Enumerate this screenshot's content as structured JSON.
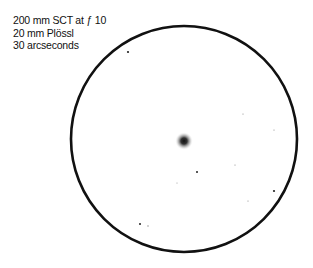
{
  "labels": {
    "line1": "200 mm SCT at ƒ 10",
    "line2": "20 mm Plössl",
    "line3": "30 arcseconds"
  },
  "field": {
    "cx": 184,
    "cy": 139,
    "r": 113,
    "ring_color": "#111111",
    "object": {
      "x": 184,
      "y": 141
    }
  },
  "stars": [
    {
      "x": 128,
      "y": 52,
      "r": 1.1
    },
    {
      "x": 197,
      "y": 172,
      "r": 1.0
    },
    {
      "x": 243,
      "y": 114,
      "r": 0.6
    },
    {
      "x": 274,
      "y": 130,
      "r": 0.6
    },
    {
      "x": 274,
      "y": 191,
      "r": 1.1
    },
    {
      "x": 248,
      "y": 201,
      "r": 0.6
    },
    {
      "x": 140,
      "y": 224,
      "r": 1.0
    },
    {
      "x": 148,
      "y": 226,
      "r": 0.7
    },
    {
      "x": 235,
      "y": 165,
      "r": 0.6
    },
    {
      "x": 177,
      "y": 183,
      "r": 0.5
    }
  ]
}
